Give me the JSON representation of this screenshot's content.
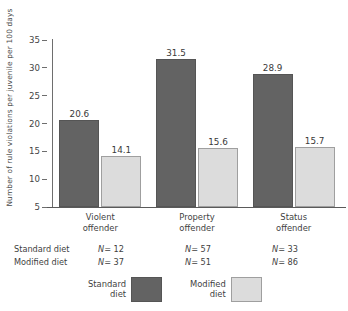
{
  "chart_data": {
    "type": "bar",
    "title": "",
    "xlabel": "",
    "ylabel": "Number of rule violations per juvenile per 100 days",
    "categories": [
      "Violent\noffender",
      "Property\noffender",
      "Status\noffender"
    ],
    "category_lines": [
      [
        "Violent",
        "offender"
      ],
      [
        "Property",
        "offender"
      ],
      [
        "Status",
        "offender"
      ]
    ],
    "series": [
      {
        "name": "Standard diet",
        "color": "#636363",
        "values": [
          20.6,
          31.5,
          28.9
        ],
        "value_labels": [
          "20.6",
          "31.5",
          "28.9"
        ]
      },
      {
        "name": "Modified diet",
        "color": "#dcdcdc",
        "values": [
          14.1,
          15.6,
          15.7
        ],
        "value_labels": [
          "14.1",
          "15.6",
          "15.7"
        ]
      }
    ],
    "ylim": [
      5,
      35
    ],
    "yticks": [
      35,
      30,
      25,
      20,
      15,
      10,
      5
    ],
    "ytick_labels": [
      "35",
      "30",
      "25",
      "20",
      "15",
      "10",
      "5"
    ],
    "grid": false,
    "legend_position": "bottom"
  },
  "annotations": {
    "rows": [
      {
        "label": "Standard diet",
        "cells": [
          "N= 12",
          "N= 57",
          "N= 33"
        ],
        "var": "N",
        "values": [
          "= 12",
          "= 57",
          "= 33"
        ]
      },
      {
        "label": "Modified diet",
        "cells": [
          "N= 37",
          "N= 51",
          "N= 86"
        ],
        "var": "N",
        "values": [
          "= 37",
          "= 51",
          "= 86"
        ]
      }
    ]
  },
  "legend": {
    "entries": [
      {
        "line1": "Standard",
        "line2": "diet",
        "color": "#636363"
      },
      {
        "line1": "Modified",
        "line2": "diet",
        "color": "#dcdcdc"
      }
    ]
  }
}
